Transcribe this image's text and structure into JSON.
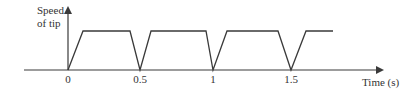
{
  "diagram": {
    "type": "speed-time graph",
    "y_axis_label_line1": "Speed",
    "y_axis_label_line2": "of tip",
    "x_axis_label": "Time (s)",
    "tick_labels": [
      "0",
      "0.5",
      "1",
      "1.5"
    ],
    "shape": "repeating trapezoid pulses: speed rises linearly from zero, holds constant, falls to zero at 0.5 s intervals",
    "line_color": "#3a3a3a"
  }
}
